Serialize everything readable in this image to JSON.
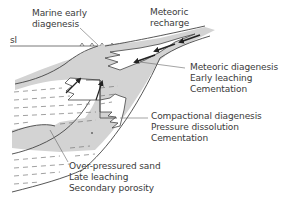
{
  "diagram": {
    "type": "geological-cross-section",
    "colors": {
      "sand_fill": "#d3d3d3",
      "line": "#444444",
      "text": "#3a3a3a",
      "background": "#ffffff",
      "shale_dash": "#666666"
    },
    "sea_level_label": "sl",
    "labels": {
      "marine": [
        "Marine early",
        "diagenesis"
      ],
      "meteoric_recharge": [
        "Meteoric",
        "recharge"
      ],
      "meteoric_diagenesis": [
        "Meteoric diagenesis",
        "Early leaching",
        "Cementation"
      ],
      "compactional": [
        "Compactional diagenesis",
        "Pressure dissolution",
        "Cementation"
      ],
      "overpressured": [
        "Over-pressured sand",
        "Late leaching",
        "Secondary porosity"
      ]
    }
  }
}
